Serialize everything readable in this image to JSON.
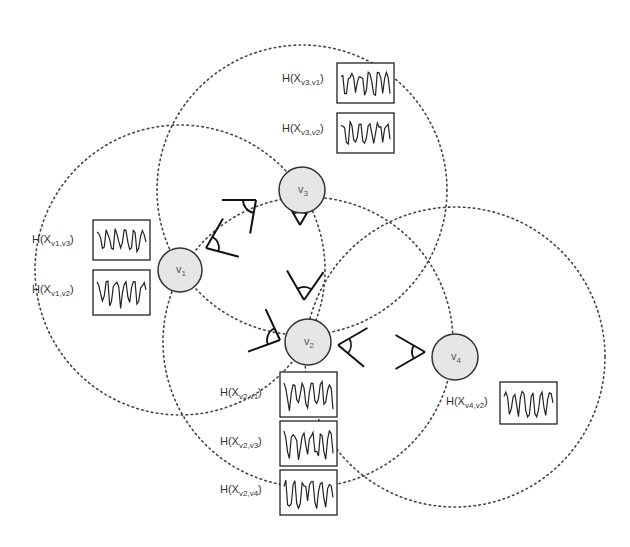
{
  "diagram": {
    "type": "camera-network-coverage",
    "colors": {
      "node_fill": "#e6e6e6",
      "node_stroke": "#333333",
      "circle_stroke": "#444444",
      "plot_stroke": "#222222",
      "background": "#ffffff"
    },
    "nodes": [
      {
        "id": "v1",
        "label": "v",
        "sub": "1",
        "cx": 180,
        "cy": 270,
        "r": 22,
        "range_r": 145
      },
      {
        "id": "v2",
        "label": "v",
        "sub": "2",
        "cx": 308,
        "cy": 342,
        "r": 23,
        "range_r": 145
      },
      {
        "id": "v3",
        "label": "v",
        "sub": "3",
        "cx": 302,
        "cy": 190,
        "r": 23,
        "range_r": 145
      },
      {
        "id": "v4",
        "label": "v",
        "sub": "4",
        "cx": 455,
        "cy": 357,
        "r": 23,
        "range_r": 150
      }
    ],
    "histograms": [
      {
        "id": "h-v3-v1",
        "prefix": "H(X",
        "sub": "v3,v1",
        "suffix": ")",
        "box": [
          337,
          63,
          57,
          40
        ],
        "label_pos": [
          282,
          82
        ]
      },
      {
        "id": "h-v3-v2",
        "prefix": "H(X",
        "sub": "v3,v2",
        "suffix": ")",
        "box": [
          337,
          113,
          57,
          40
        ],
        "label_pos": [
          282,
          132
        ]
      },
      {
        "id": "h-v1-v3",
        "prefix": "H(X",
        "sub": "v1,v3",
        "suffix": ")",
        "box": [
          93,
          220,
          57,
          40
        ],
        "label_pos": [
          32,
          243
        ]
      },
      {
        "id": "h-v1-v2",
        "prefix": "H(X",
        "sub": "v1,v2",
        "suffix": ")",
        "box": [
          93,
          270,
          57,
          45
        ],
        "label_pos": [
          32,
          293
        ]
      },
      {
        "id": "h-v2-v1",
        "prefix": "H(X",
        "sub": "v2,v1",
        "suffix": ")",
        "box": [
          280,
          372,
          57,
          45
        ],
        "label_pos": [
          220,
          396
        ]
      },
      {
        "id": "h-v2-v3",
        "prefix": "H(X",
        "sub": "v2,v3",
        "suffix": ")",
        "box": [
          280,
          421,
          57,
          45
        ],
        "label_pos": [
          220,
          445
        ]
      },
      {
        "id": "h-v2-v4",
        "prefix": "H(X",
        "sub": "v2,v4",
        "suffix": ")",
        "box": [
          280,
          470,
          57,
          45
        ],
        "label_pos": [
          220,
          493
        ]
      },
      {
        "id": "h-v4-v2",
        "prefix": "H(X",
        "sub": "v4,v2",
        "suffix": ")",
        "box": [
          500,
          382,
          57,
          42
        ],
        "label_pos": [
          446,
          405
        ]
      }
    ]
  }
}
